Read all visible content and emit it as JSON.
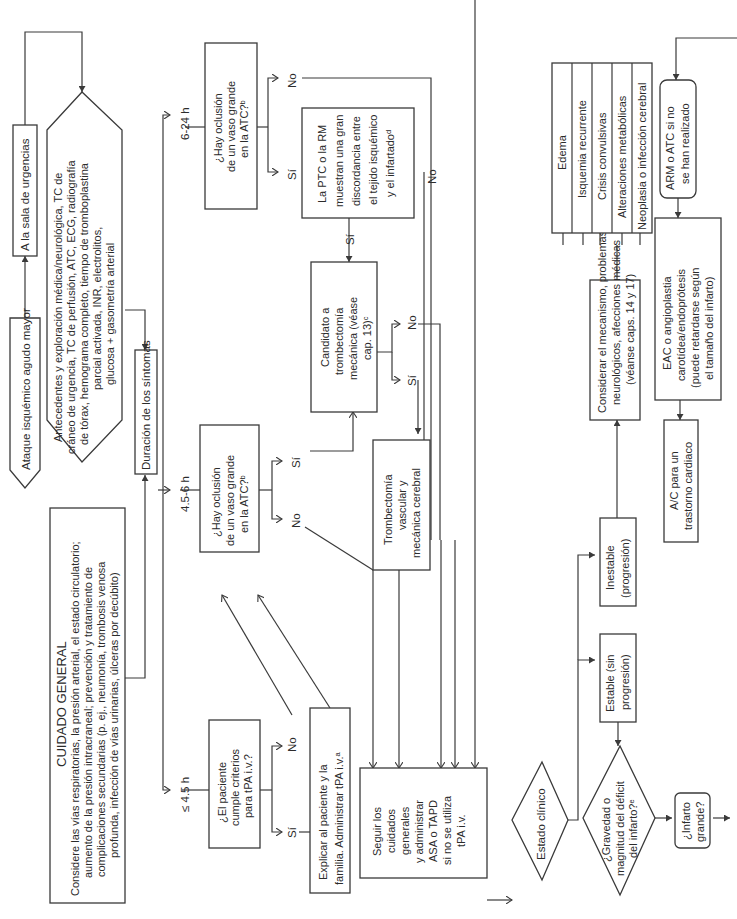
{
  "diagram": {
    "orientation": "rotated-90-ccw",
    "start": "Ataque isquémico agudo mayor",
    "er": "A la sala de urgencias",
    "workup": [
      "Antecedentes y exploración médica/neurológica, TC de",
      "cráneo de urgencia, TC de perfusión, ATC, ECG, radiografía",
      "de tórax, hemograma completo, tiempo de tromboplastina",
      "parcial activada, INR, electrolitos,",
      "glucosa + gasometría arterial"
    ],
    "general_care": {
      "title": "CUIDADO GENERAL",
      "lines": [
        "Considere las vías respiratorias, la presión arterial, el estado circulatorio;",
        "aumento de la presión intracraneal; prevención y tratamiento de",
        "complicaciones secundarias (p. ej., neumonía, trombosis venosa",
        "profunda, infección de vías urinarias, úlceras por decúbito)"
      ]
    },
    "duration": "Duración de los síntomas",
    "branches": {
      "early": "≤ 4.5 h",
      "mid": "4.5-6 h",
      "late": "6-24 h"
    },
    "tpa_question": [
      "¿El paciente",
      "cumple criterios",
      "para tPA i.v.?"
    ],
    "tpa_yes": [
      "Explicar al paciente y la",
      "familia. Administrar tPA i.v.ᵃ"
    ],
    "lvo_mid": [
      "¿Hay oclusión",
      "de un vaso grande",
      "en la ATC?ᵇ"
    ],
    "lvo_late": [
      "¿Hay oclusión",
      "de un vaso grande",
      "en la ATC?ᵇ"
    ],
    "mismatch": [
      "La PTC o la RM",
      "muestran una gran",
      "discordancia entre",
      "el tejido isquémico",
      "y el infartadoᵈ"
    ],
    "candidate": [
      "Candidato a",
      "trombectomía",
      "mecánica (véase",
      "cap. 13)ᶜ"
    ],
    "thrombectomy": [
      "Trombectomía",
      "vascular y",
      "mecánica cerebral"
    ],
    "follow_care": [
      "Seguir los",
      "cuidados",
      "generales",
      "y administrar",
      "ASA o TAPD",
      "si no se utiliza",
      "tPA i.v."
    ],
    "clinical_state": "Estado clínico",
    "stable": [
      "Estable (sin",
      "progresión)"
    ],
    "unstable": [
      "Inestable",
      "(progresión)"
    ],
    "consider": [
      "Considerar el mecanismo, problemas",
      "neurológicos, afecciones médicas",
      "(véanse caps. 14 y 17)"
    ],
    "complications": [
      "Edema",
      "Isquemia recurrente",
      "Crisis convulsivas",
      "Alteraciones metabólicas",
      "Neoplasia o infección cerebral"
    ],
    "severity": [
      "¿Gravedad o",
      "magnitud del déficit",
      "del infarto?ᵉ"
    ],
    "large_infarct": [
      "¿Infarto",
      "grande?"
    ],
    "arm_atc": [
      "ARM o ATC si no",
      "se han realizado"
    ],
    "eac": [
      "EAC o angioplastia",
      "carotídea/endoprótesis",
      "(puede retardarse según",
      "el tamaño del infarto)"
    ],
    "ac": [
      "A/C para un",
      "trastorno cardiaco"
    ],
    "labels": {
      "yes": "Sí",
      "no": "No"
    }
  }
}
